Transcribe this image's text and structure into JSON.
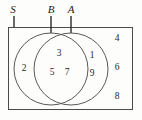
{
  "figure": {
    "type": "venn-diagram",
    "universe_label": "S",
    "set_labels": {
      "left_circle": "B",
      "right_circle": "A"
    },
    "regions": [
      {
        "name": "universe-only",
        "description": "inside S, outside both circles",
        "elements": [
          "4",
          "6",
          "8"
        ]
      },
      {
        "name": "b-only",
        "description": "inside B only",
        "elements": [
          "2"
        ]
      },
      {
        "name": "intersection",
        "description": "inside both A and B",
        "elements": [
          "3",
          "5",
          "7"
        ]
      },
      {
        "name": "a-only",
        "description": "inside A only",
        "elements": [
          "1",
          "9"
        ]
      }
    ]
  },
  "labels": {
    "s": "S",
    "b": "B",
    "a": "A"
  },
  "numbers": {
    "b_only_1": "2",
    "inter_1": "3",
    "inter_2": "5",
    "inter_3": "7",
    "a_only_1": "1",
    "a_only_2": "9",
    "outside_1": "4",
    "outside_2": "6",
    "outside_3": "8"
  },
  "colors": {
    "background": "#fdfdfb",
    "stroke": "#4a4a4a",
    "circle_stroke": "#5a5a5a",
    "text": "#1f1f1f",
    "leader": "#2a2a2a"
  }
}
